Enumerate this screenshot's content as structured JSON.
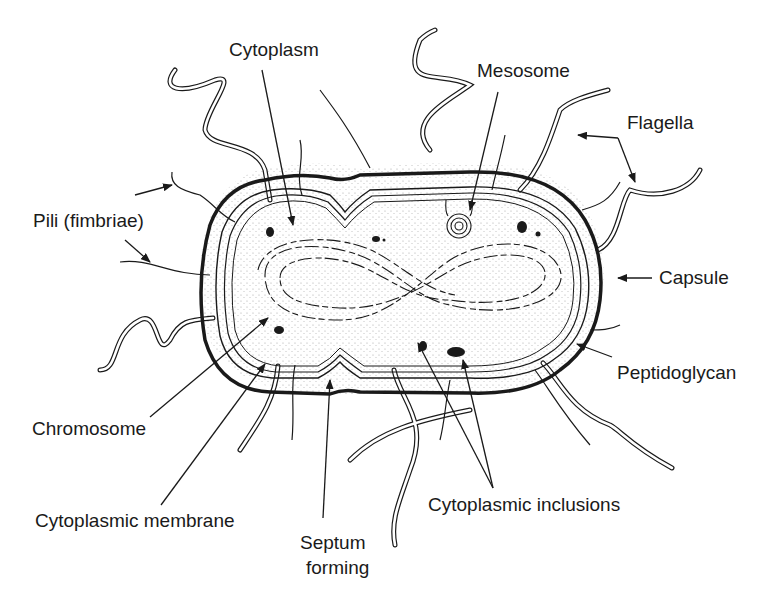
{
  "diagram": {
    "labels": {
      "cytoplasm": "Cytoplasm",
      "mesosome": "Mesosome",
      "flagella": "Flagella",
      "pili": "Pili (fimbriae)",
      "capsule": "Capsule",
      "peptidoglycan": "Peptidoglycan",
      "chromosome": "Chromosome",
      "cytoplasmic_membrane": "Cytoplasmic membrane",
      "septum_line1": "Septum",
      "septum_line2": "forming",
      "inclusions": "Cytoplasmic inclusions"
    },
    "colors": {
      "ink": "#1a1a1a",
      "background": "#ffffff",
      "stipple": "#9a9a9a"
    }
  }
}
